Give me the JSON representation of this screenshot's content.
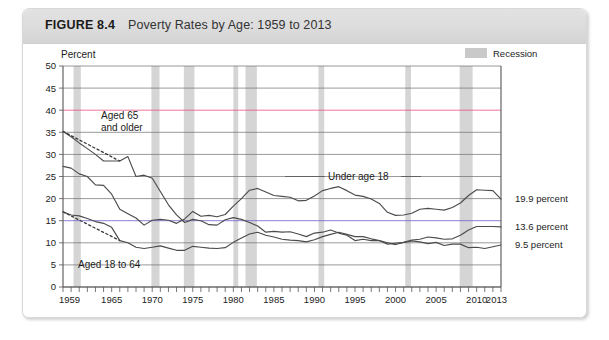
{
  "figure": {
    "number": "FIGURE 8.4",
    "title": "Poverty Rates by Age: 1959 to 2013"
  },
  "legend": {
    "recession_label": "Recession",
    "swatch_color": "#c9c9c9"
  },
  "annotations": {
    "aged65_line1": "Aged 65",
    "aged65_line2": "and older",
    "aged18to64": "Aged 18 to 64",
    "under18": "Under age 18"
  },
  "end_labels": {
    "under18": "19.9 percent",
    "aged18to64": "13.6 percent",
    "aged65": "9.5 percent"
  },
  "axis": {
    "y_title": "Percent",
    "y_ticks": [
      "0",
      "5",
      "10",
      "15",
      "20",
      "25",
      "30",
      "35",
      "40",
      "45",
      "50"
    ],
    "x_ticks": [
      "1959",
      "1965",
      "1970",
      "1975",
      "1980",
      "1985",
      "1990",
      "1995",
      "2000",
      "2005",
      "2010",
      "2013"
    ]
  },
  "chart_data": {
    "type": "line",
    "title": "Poverty Rates by Age: 1959 to 2013",
    "xlabel": "",
    "ylabel": "Percent",
    "xlim": [
      1959,
      2013
    ],
    "ylim": [
      0,
      50
    ],
    "grid": true,
    "legend_position": "top-right",
    "gridline_colors": {
      "40": "#e8547e",
      "15": "#6a62c8"
    },
    "recession_bands": [
      [
        1960.3,
        1961.2
      ],
      [
        1969.9,
        1970.9
      ],
      [
        1973.9,
        1975.2
      ],
      [
        1980.0,
        1980.6
      ],
      [
        1981.5,
        1982.9
      ],
      [
        1990.5,
        1991.2
      ],
      [
        2001.2,
        2001.9
      ],
      [
        2007.9,
        2009.5
      ]
    ],
    "series": [
      {
        "name": "Under age 18",
        "end_label": "19.9 percent",
        "x": [
          1959,
          1960,
          1961,
          1962,
          1963,
          1964,
          1965,
          1966,
          1967,
          1968,
          1969,
          1970,
          1971,
          1972,
          1973,
          1974,
          1975,
          1976,
          1977,
          1978,
          1979,
          1980,
          1981,
          1982,
          1983,
          1984,
          1985,
          1986,
          1987,
          1988,
          1989,
          1990,
          1991,
          1992,
          1993,
          1994,
          1995,
          1996,
          1997,
          1998,
          1999,
          2000,
          2001,
          2002,
          2003,
          2004,
          2005,
          2006,
          2007,
          2008,
          2009,
          2010,
          2011,
          2012,
          2013
        ],
        "values": [
          27.3,
          26.9,
          25.6,
          25.0,
          23.1,
          23.0,
          21.0,
          17.6,
          16.6,
          15.6,
          14.0,
          15.1,
          15.3,
          15.1,
          14.4,
          15.4,
          17.1,
          16.0,
          16.2,
          15.9,
          16.4,
          18.3,
          20.0,
          21.9,
          22.3,
          21.5,
          20.7,
          20.5,
          20.3,
          19.5,
          19.6,
          20.6,
          21.8,
          22.3,
          22.7,
          21.8,
          20.8,
          20.5,
          19.9,
          18.9,
          16.9,
          16.2,
          16.3,
          16.7,
          17.6,
          17.8,
          17.6,
          17.4,
          18.0,
          19.0,
          20.7,
          22.0,
          21.9,
          21.8,
          19.9
        ]
      },
      {
        "name": "Aged 18 to 64",
        "end_label": "13.6 percent",
        "x": [
          1959,
          1960,
          1961,
          1962,
          1963,
          1964,
          1965,
          1966,
          1967,
          1968,
          1969,
          1970,
          1971,
          1972,
          1973,
          1974,
          1975,
          1976,
          1977,
          1978,
          1979,
          1980,
          1981,
          1982,
          1983,
          1984,
          1985,
          1986,
          1987,
          1988,
          1989,
          1990,
          1991,
          1992,
          1993,
          1994,
          1995,
          1996,
          1997,
          1998,
          1999,
          2000,
          2001,
          2002,
          2003,
          2004,
          2005,
          2006,
          2007,
          2008,
          2009,
          2010,
          2011,
          2012,
          2013
        ],
        "values": [
          17.0,
          16.3,
          16.1,
          15.5,
          14.8,
          14.4,
          13.5,
          10.5,
          10.0,
          9.0,
          8.7,
          9.0,
          9.3,
          8.8,
          8.3,
          8.3,
          9.2,
          9.0,
          8.8,
          8.7,
          8.9,
          10.1,
          11.1,
          12.0,
          12.4,
          11.7,
          11.3,
          10.8,
          10.6,
          10.5,
          10.2,
          10.7,
          11.4,
          11.9,
          12.4,
          11.9,
          11.4,
          11.4,
          10.9,
          10.5,
          10.0,
          9.6,
          10.1,
          10.6,
          10.8,
          11.3,
          11.1,
          10.8,
          10.9,
          11.7,
          12.9,
          13.7,
          13.7,
          13.7,
          13.6
        ]
      },
      {
        "name": "Aged 65 and older",
        "end_label": "9.5 percent",
        "x": [
          1959,
          1960,
          1961,
          1962,
          1963,
          1964,
          1965,
          1966,
          1967,
          1968,
          1969,
          1970,
          1971,
          1972,
          1973,
          1974,
          1975,
          1976,
          1977,
          1978,
          1979,
          1980,
          1981,
          1982,
          1983,
          1984,
          1985,
          1986,
          1987,
          1988,
          1989,
          1990,
          1991,
          1992,
          1993,
          1994,
          1995,
          1996,
          1997,
          1998,
          1999,
          2000,
          2001,
          2002,
          2003,
          2004,
          2005,
          2006,
          2007,
          2008,
          2009,
          2010,
          2011,
          2012,
          2013
        ],
        "values": [
          35.2,
          34.0,
          32.6,
          31.3,
          30.0,
          28.5,
          28.5,
          28.5,
          29.5,
          25.0,
          25.3,
          24.6,
          21.6,
          18.6,
          16.3,
          14.6,
          15.3,
          15.0,
          14.1,
          14.0,
          15.2,
          15.7,
          15.3,
          14.6,
          13.8,
          12.4,
          12.6,
          12.4,
          12.5,
          12.0,
          11.4,
          12.2,
          12.4,
          12.9,
          12.2,
          11.7,
          10.5,
          10.8,
          10.5,
          10.5,
          9.7,
          9.9,
          10.1,
          10.4,
          10.2,
          9.8,
          10.1,
          9.4,
          9.7,
          9.7,
          8.9,
          9.0,
          8.7,
          9.1,
          9.5
        ]
      }
    ],
    "dotted_interpolations": [
      {
        "series": "Aged 65 and older",
        "from": [
          1959,
          35.2
        ],
        "to": [
          1966,
          28.5
        ]
      },
      {
        "series": "Aged 18 to 64",
        "from": [
          1959,
          17.0
        ],
        "to": [
          1966,
          10.5
        ]
      }
    ]
  }
}
